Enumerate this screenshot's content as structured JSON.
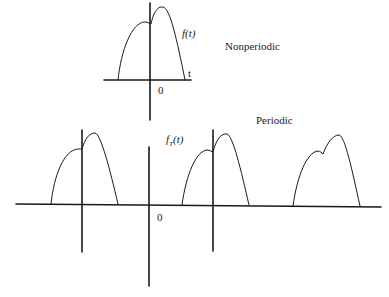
{
  "top_diagram": {
    "function_label": "f(t)",
    "axis_label": "t",
    "origin_label": "0",
    "caption": "Nonperiodic"
  },
  "bottom_diagram": {
    "function_label_base": "f",
    "function_label_sub": "T",
    "function_label_arg": "(t)",
    "origin_label": "0",
    "caption": "Periodic"
  },
  "colors": {
    "stroke": "#1a1a1a",
    "background": "#ffffff"
  }
}
